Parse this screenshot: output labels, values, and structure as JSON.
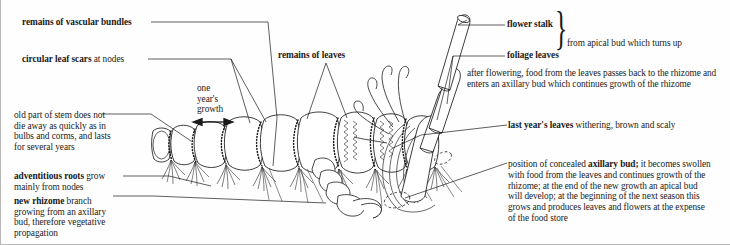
{
  "figure": {
    "background": "#fefefe",
    "ink": "#1a1a1a"
  },
  "labels": {
    "vascular_bundles": "remains of vascular bundles",
    "leaf_scars_bold": "circular leaf scars",
    "leaf_scars_rest": " at nodes",
    "remains_of_leaves": "remains of leaves",
    "one_years_growth": "one\nyear's\ngrowth",
    "flower_stalk": "flower stalk",
    "foliage_leaves": "foliage leaves",
    "brace_note": "from apical bud which turns up",
    "last_years_leaves_bold": "last year's leaves",
    "last_years_leaves_rest": " withering, brown and scaly",
    "adventitious_roots_bold": "adventitious roots",
    "adventitious_roots_rest": " grow\nmainly from nodes",
    "new_rhizome_bold": "new rhizome",
    "new_rhizome_rest": " branch\ngrowing from an axillary\nbud, therefore vegetative\npropagation",
    "old_stem": "old part of stem does not\ndie away as quickly as in\nbulbs and corms, and lasts\nfor several years"
  },
  "paragraphs": {
    "after_flowering": "after flowering, food from the leaves passes back to the\nrhizome and enters an axillary bud which continues\ngrowth of the rhizome",
    "axillary_bud_pre": "position of concealed ",
    "axillary_bud_bold": "axillary bud;",
    "axillary_bud_post": " it becomes swollen\nwith food from the leaves and continues growth of the\nrhizome; at the end of the new growth an apical bud\nwill develop; at the beginning of the next season this\ngrows and produces leaves and flowers at the expense\nof the food store"
  },
  "icons": {
    "brace": "brace-icon",
    "double_arrow": "double-headed-arrow-icon",
    "dashed_ellipse": "dashed-ellipse-icon"
  }
}
